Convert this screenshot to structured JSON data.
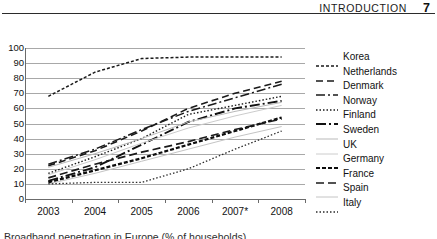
{
  "header": {
    "title": "Introduction",
    "page_number": "7"
  },
  "caption": {
    "text": "Broadband penetration in Europe (% of households)"
  },
  "chart_data": {
    "type": "line",
    "title": "",
    "subtitle": "",
    "xlabel": "",
    "ylabel": "",
    "x": [
      "2003",
      "2004",
      "2005",
      "2006",
      "2007*",
      "2008"
    ],
    "categories": [
      "2003",
      "2004",
      "2005",
      "2006",
      "2007*",
      "2008"
    ],
    "ylim": [
      0,
      100
    ],
    "yticks": [
      0,
      10,
      20,
      30,
      40,
      50,
      60,
      70,
      80,
      90,
      100
    ],
    "ytick_labels": [
      "0",
      "10",
      "20",
      "30",
      "40",
      "50",
      "60",
      "70",
      "80",
      "90",
      "100"
    ],
    "grid": "horizontal",
    "legend_position": "right",
    "series": [
      {
        "name": "Korea",
        "dash": "3,2",
        "width": 1.5,
        "color": "#1a1a1a",
        "values": [
          68,
          84,
          93,
          94,
          94,
          94
        ]
      },
      {
        "name": "Netherlands",
        "dash": "7,4",
        "width": 1.6,
        "color": "#1a1a1a",
        "values": [
          22,
          32,
          45,
          60,
          70,
          78
        ]
      },
      {
        "name": "Denmark",
        "dash": "9,3,2,3",
        "width": 1.5,
        "color": "#1a1a1a",
        "values": [
          23,
          33,
          46,
          58,
          67,
          76
        ]
      },
      {
        "name": "Norway",
        "dash": "1.5,2",
        "width": 1.4,
        "color": "#1a1a1a",
        "values": [
          17,
          28,
          40,
          56,
          62,
          68
        ]
      },
      {
        "name": "Finland",
        "dash": "10,3,2,3",
        "width": 1.9,
        "color": "#111111",
        "values": [
          12,
          21,
          36,
          51,
          60,
          65
        ]
      },
      {
        "name": "Sweden",
        "dash": "0",
        "width": 1.0,
        "color": "#b9b9b9",
        "values": [
          21,
          30,
          40,
          51,
          58,
          64
        ]
      },
      {
        "name": "UK",
        "dash": "0",
        "width": 1.0,
        "color": "#cccccc",
        "values": [
          16,
          26,
          37,
          47,
          55,
          62
        ]
      },
      {
        "name": "Germany",
        "dash": "4,2",
        "width": 2.2,
        "color": "#0d0d0d",
        "values": [
          11,
          19,
          27,
          36,
          45,
          54
        ]
      },
      {
        "name": "France",
        "dash": "8,4",
        "width": 1.7,
        "color": "#1a1a1a",
        "values": [
          14,
          23,
          31,
          38,
          46,
          53
        ]
      },
      {
        "name": "Spain",
        "dash": "0",
        "width": 1.0,
        "color": "#c4c4c4",
        "values": [
          10,
          17,
          25,
          33,
          41,
          48
        ]
      },
      {
        "name": "Italy",
        "dash": "1.5,2",
        "width": 1.3,
        "color": "#2b2b2b",
        "values": [
          10,
          11,
          11,
          20,
          33,
          45
        ]
      }
    ]
  }
}
